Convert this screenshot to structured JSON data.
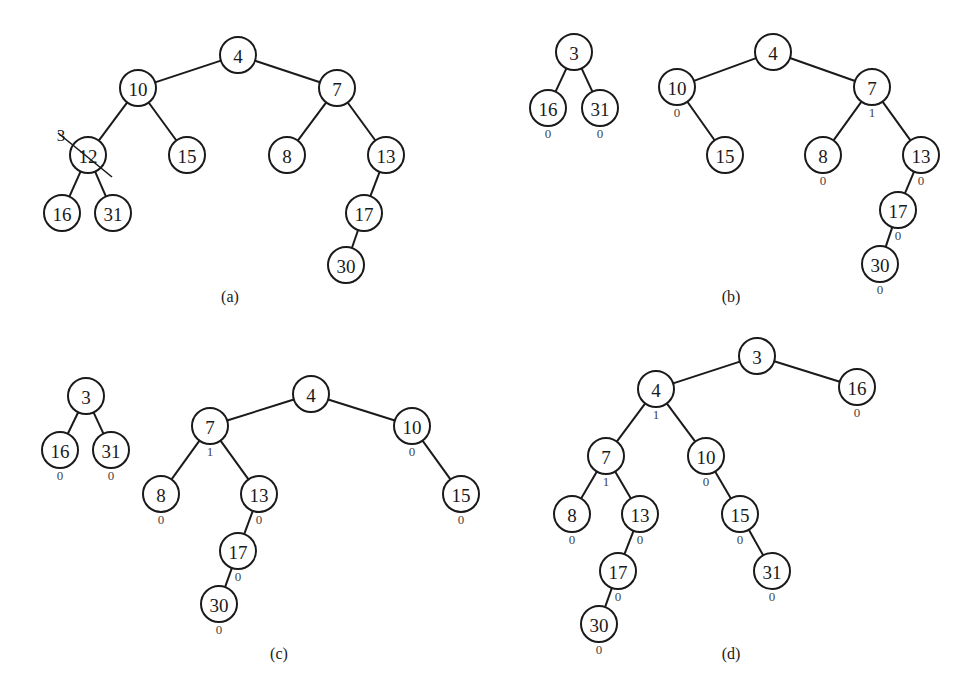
{
  "figure": {
    "panels": [
      {
        "id": "a",
        "caption": "(a)",
        "trees": [
          {
            "nodes": [
              {
                "id": "a4",
                "label": "4",
                "x": 238,
                "y": 55
              },
              {
                "id": "a10",
                "label": "10",
                "x": 138,
                "y": 88
              },
              {
                "id": "a7",
                "label": "7",
                "x": 337,
                "y": 88
              },
              {
                "id": "a12",
                "label": "12",
                "x": 88,
                "y": 155,
                "crossed_out": true,
                "replacement": "3"
              },
              {
                "id": "a15",
                "label": "15",
                "x": 187,
                "y": 155
              },
              {
                "id": "a8",
                "label": "8",
                "x": 287,
                "y": 155
              },
              {
                "id": "a13",
                "label": "13",
                "x": 386,
                "y": 155
              },
              {
                "id": "a16",
                "label": "16",
                "x": 62,
                "y": 213
              },
              {
                "id": "a31",
                "label": "31",
                "x": 113,
                "y": 213
              },
              {
                "id": "a17",
                "label": "17",
                "x": 364,
                "y": 213
              },
              {
                "id": "a30",
                "label": "30",
                "x": 346,
                "y": 265
              }
            ],
            "edges": [
              [
                "a4",
                "a10"
              ],
              [
                "a4",
                "a7"
              ],
              [
                "a10",
                "a12"
              ],
              [
                "a10",
                "a15"
              ],
              [
                "a7",
                "a8"
              ],
              [
                "a7",
                "a13"
              ],
              [
                "a12",
                "a16"
              ],
              [
                "a12",
                "a31"
              ],
              [
                "a13",
                "a17"
              ],
              [
                "a17",
                "a30"
              ]
            ]
          }
        ],
        "caption_pos": {
          "x": 230,
          "y": 302
        }
      },
      {
        "id": "b",
        "caption": "(b)",
        "trees": [
          {
            "nodes": [
              {
                "id": "b3",
                "label": "3",
                "x": 574,
                "y": 52
              },
              {
                "id": "b16",
                "label": "16",
                "x": 548,
                "y": 108,
                "rank": "0"
              },
              {
                "id": "b31",
                "label": "31",
                "x": 600,
                "y": 108,
                "rank": "0"
              }
            ],
            "edges": [
              [
                "b3",
                "b16"
              ],
              [
                "b3",
                "b31"
              ]
            ]
          },
          {
            "nodes": [
              {
                "id": "b4",
                "label": "4",
                "x": 773,
                "y": 52
              },
              {
                "id": "b10",
                "label": "10",
                "x": 677,
                "y": 87,
                "rank": "0"
              },
              {
                "id": "b7",
                "label": "7",
                "x": 872,
                "y": 87,
                "rank": "1"
              },
              {
                "id": "b15",
                "label": "15",
                "x": 725,
                "y": 155
              },
              {
                "id": "b8",
                "label": "8",
                "x": 823,
                "y": 155,
                "rank": "0"
              },
              {
                "id": "b13",
                "label": "13",
                "x": 921,
                "y": 155,
                "rank": "0"
              },
              {
                "id": "b17",
                "label": "17",
                "x": 898,
                "y": 210,
                "rank": "0"
              },
              {
                "id": "b30",
                "label": "30",
                "x": 880,
                "y": 264,
                "rank": "0"
              }
            ],
            "edges": [
              [
                "b4",
                "b10"
              ],
              [
                "b4",
                "b7"
              ],
              [
                "b10",
                "b15"
              ],
              [
                "b7",
                "b8"
              ],
              [
                "b7",
                "b13"
              ],
              [
                "b13",
                "b17"
              ],
              [
                "b17",
                "b30"
              ]
            ]
          }
        ],
        "caption_pos": {
          "x": 731,
          "y": 302
        }
      },
      {
        "id": "c",
        "caption": "(c)",
        "trees": [
          {
            "nodes": [
              {
                "id": "c3",
                "label": "3",
                "x": 86,
                "y": 396
              },
              {
                "id": "c16",
                "label": "16",
                "x": 60,
                "y": 450,
                "rank": "0"
              },
              {
                "id": "c31",
                "label": "31",
                "x": 111,
                "y": 450,
                "rank": "0"
              }
            ],
            "edges": [
              [
                "c3",
                "c16"
              ],
              [
                "c3",
                "c31"
              ]
            ]
          },
          {
            "nodes": [
              {
                "id": "c4",
                "label": "4",
                "x": 311,
                "y": 394
              },
              {
                "id": "c7",
                "label": "7",
                "x": 210,
                "y": 426,
                "rank": "1"
              },
              {
                "id": "c10",
                "label": "10",
                "x": 412,
                "y": 426,
                "rank": "0"
              },
              {
                "id": "c8",
                "label": "8",
                "x": 161,
                "y": 494,
                "rank": "0"
              },
              {
                "id": "c13",
                "label": "13",
                "x": 259,
                "y": 494,
                "rank": "0"
              },
              {
                "id": "c15",
                "label": "15",
                "x": 461,
                "y": 494,
                "rank": "0"
              },
              {
                "id": "c17",
                "label": "17",
                "x": 238,
                "y": 551,
                "rank": "0"
              },
              {
                "id": "c30",
                "label": "30",
                "x": 219,
                "y": 604,
                "rank": "0"
              }
            ],
            "edges": [
              [
                "c4",
                "c7"
              ],
              [
                "c4",
                "c10"
              ],
              [
                "c7",
                "c8"
              ],
              [
                "c7",
                "c13"
              ],
              [
                "c10",
                "c15"
              ],
              [
                "c13",
                "c17"
              ],
              [
                "c17",
                "c30"
              ]
            ]
          }
        ],
        "caption_pos": {
          "x": 279,
          "y": 659
        }
      },
      {
        "id": "d",
        "caption": "(d)",
        "trees": [
          {
            "nodes": [
              {
                "id": "d3",
                "label": "3",
                "x": 757,
                "y": 356
              },
              {
                "id": "d4",
                "label": "4",
                "x": 656,
                "y": 389,
                "rank": "1"
              },
              {
                "id": "d16",
                "label": "16",
                "x": 857,
                "y": 387,
                "rank": "0"
              },
              {
                "id": "d7",
                "label": "7",
                "x": 606,
                "y": 456,
                "rank": "1"
              },
              {
                "id": "d10",
                "label": "10",
                "x": 706,
                "y": 456,
                "rank": "0"
              },
              {
                "id": "d8",
                "label": "8",
                "x": 572,
                "y": 514,
                "rank": "0"
              },
              {
                "id": "d13",
                "label": "13",
                "x": 640,
                "y": 514,
                "rank": "0"
              },
              {
                "id": "d15",
                "label": "15",
                "x": 740,
                "y": 514,
                "rank": "0"
              },
              {
                "id": "d17",
                "label": "17",
                "x": 618,
                "y": 571,
                "rank": "0"
              },
              {
                "id": "d31",
                "label": "31",
                "x": 772,
                "y": 571,
                "rank": "0"
              },
              {
                "id": "d30",
                "label": "30",
                "x": 599,
                "y": 624,
                "rank": "0"
              }
            ],
            "edges": [
              [
                "d3",
                "d4"
              ],
              [
                "d3",
                "d16"
              ],
              [
                "d4",
                "d7"
              ],
              [
                "d4",
                "d10"
              ],
              [
                "d7",
                "d8"
              ],
              [
                "d7",
                "d13"
              ],
              [
                "d10",
                "d15"
              ],
              [
                "d13",
                "d17"
              ],
              [
                "d15",
                "d31"
              ],
              [
                "d17",
                "d30"
              ]
            ]
          }
        ],
        "caption_pos": {
          "x": 731,
          "y": 659
        }
      }
    ]
  }
}
